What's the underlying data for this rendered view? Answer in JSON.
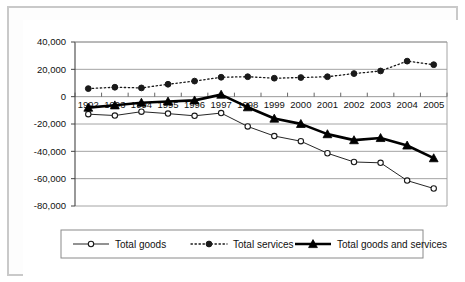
{
  "chart_data": {
    "type": "line",
    "title": "",
    "subtitle": "",
    "xlabel": "",
    "ylabel": "",
    "categories": [
      "1992",
      "1993",
      "1994",
      "1995",
      "1996",
      "1997",
      "1998",
      "1999",
      "2000",
      "2001",
      "2002",
      "2003",
      "2004",
      "2005"
    ],
    "ylim": [
      -80000,
      40000
    ],
    "ytick_labels": [
      "40,000",
      "20,000",
      "0",
      "-20,000",
      "-40,000",
      "-60,000",
      "-80,000"
    ],
    "ytick_values": [
      40000,
      20000,
      0,
      -20000,
      -40000,
      -60000,
      -80000
    ],
    "grid": true,
    "legend_position": "bottom",
    "series": [
      {
        "name": "Total goods",
        "marker": "open-circle",
        "line_style": "solid-thin",
        "color": "#1a1a1a",
        "values": [
          -12800,
          -13800,
          -11000,
          -12400,
          -14000,
          -12000,
          -21800,
          -28800,
          -32600,
          -41400,
          -47800,
          -48400,
          -61400,
          -67200
        ]
      },
      {
        "name": "Total services",
        "marker": "filled-circle",
        "line_style": "dotted",
        "color": "#1a1a1a",
        "values": [
          5900,
          6900,
          6400,
          9100,
          11400,
          14200,
          14600,
          13500,
          14000,
          14600,
          16900,
          18800,
          26000,
          23400
        ]
      },
      {
        "name": "Total goods and services",
        "marker": "filled-triangle",
        "line_style": "solid-thick",
        "color": "#000000",
        "values": [
          -8000,
          -6300,
          -4400,
          -3500,
          -2700,
          1500,
          -7700,
          -16000,
          -19900,
          -27400,
          -31800,
          -30200,
          -35700,
          -45000
        ]
      }
    ]
  },
  "legend": {
    "items": [
      {
        "label": "Total goods",
        "marker": "open-circle-icon"
      },
      {
        "label": "Total services",
        "marker": "filled-circle-icon"
      },
      {
        "label": "Total goods and services",
        "marker": "filled-triangle-icon"
      }
    ]
  },
  "colors": {
    "axis": "#6f6f6f",
    "grid": "#9a9a9a",
    "text": "#111111",
    "frame": "#c9c9c9",
    "series_dark": "#1a1a1a"
  }
}
